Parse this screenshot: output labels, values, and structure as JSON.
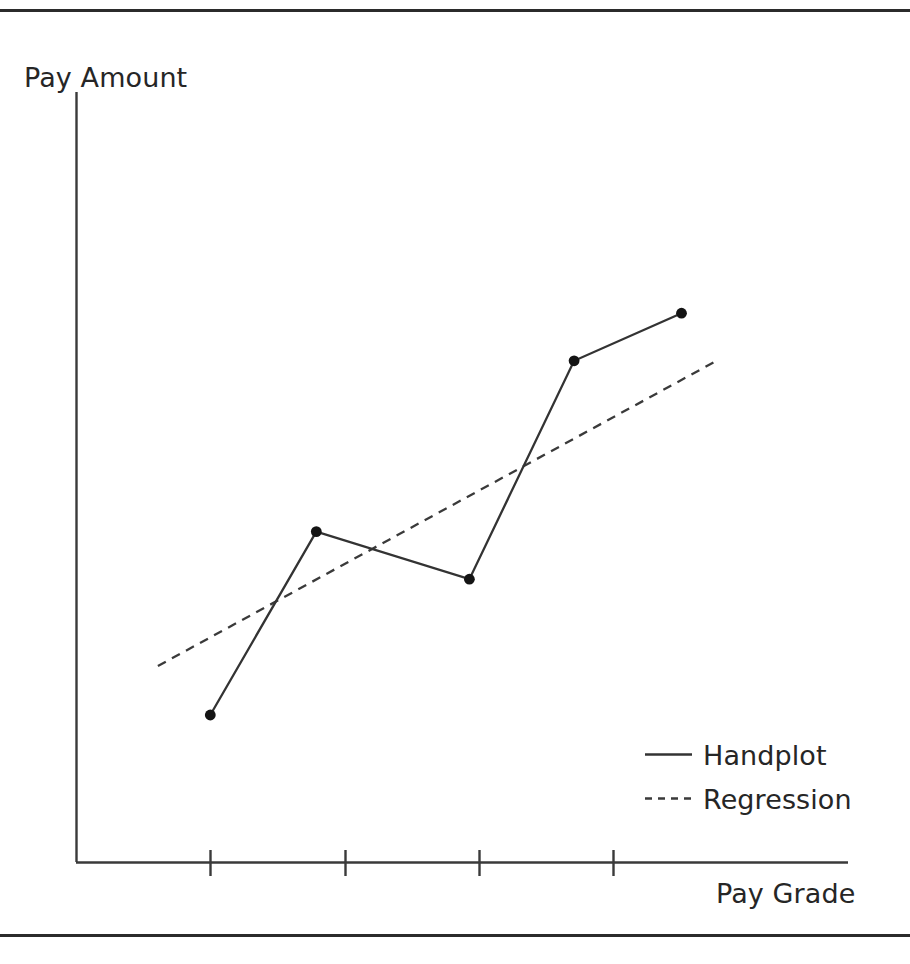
{
  "figure": {
    "frame_color": "#2b2b2b",
    "axis_color": "#3a3a3a",
    "plot_color": "#333333",
    "text_color": "#262626"
  },
  "chart_data": {
    "type": "line",
    "title": "",
    "subtitle": "",
    "xlabel": "Pay Grade",
    "ylabel": "Pay Amount",
    "grid": false,
    "legend_position": "bottom-right",
    "xlim": [
      0,
      5.75
    ],
    "ylim": [
      0,
      5.5
    ],
    "xticks": [
      1,
      2,
      3,
      4
    ],
    "xticklabels": [
      "",
      "",
      "",
      ""
    ],
    "yticks": [],
    "yticklabels": [],
    "series": [
      {
        "name": "Handplot",
        "style": "solid",
        "marker": "circle",
        "x": [
          1,
          1.79,
          2.93,
          3.71,
          4.51
        ],
        "y": [
          1.05,
          2.36,
          2.02,
          3.58,
          3.92
        ],
        "points": [
          {
            "x": 1.0,
            "y": 1.05
          },
          {
            "x": 1.79,
            "y": 2.36
          },
          {
            "x": 2.93,
            "y": 2.02
          },
          {
            "x": 3.71,
            "y": 3.58
          },
          {
            "x": 4.51,
            "y": 3.92
          }
        ]
      },
      {
        "name": "Regression",
        "style": "dashed",
        "marker": "none",
        "x": [
          0.61,
          4.79
        ],
        "y": [
          1.4,
          3.59
        ],
        "points": [
          {
            "x": 0.61,
            "y": 1.4
          },
          {
            "x": 4.79,
            "y": 3.59
          }
        ]
      }
    ],
    "annotations": []
  },
  "legend": {
    "entries": [
      {
        "label": "Handplot",
        "style": "solid"
      },
      {
        "label": "Regression",
        "style": "dashed"
      }
    ]
  }
}
